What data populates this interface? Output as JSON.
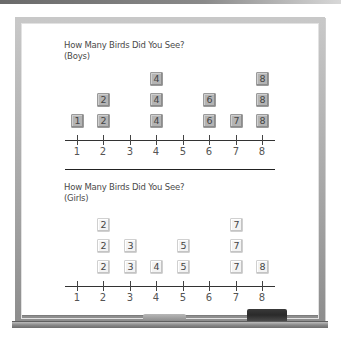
{
  "chart_data": [
    {
      "type": "dot-plot",
      "title": "How Many Birds Did You See?",
      "subtitle": "(Boys)",
      "categories": [
        1,
        2,
        3,
        4,
        5,
        6,
        7,
        8
      ],
      "values": [
        1,
        2,
        0,
        3,
        0,
        2,
        1,
        3
      ],
      "xlabel": "",
      "ylabel": "",
      "xlim": [
        1,
        8
      ],
      "tile_color": "#b4b4b4"
    },
    {
      "type": "dot-plot",
      "title": "How Many Birds Did You See?",
      "subtitle": "(Girls)",
      "categories": [
        1,
        2,
        3,
        4,
        5,
        6,
        7,
        8
      ],
      "values": [
        0,
        3,
        2,
        1,
        2,
        0,
        3,
        1
      ],
      "xlabel": "",
      "ylabel": "",
      "xlim": [
        1,
        8
      ],
      "tile_color": "#f3f3f3"
    }
  ],
  "boys": {
    "title": "How Many Birds Did You See?",
    "subtitle": "(Boys)",
    "tick_labels": [
      "1",
      "2",
      "3",
      "4",
      "5",
      "6",
      "7",
      "8"
    ]
  },
  "girls": {
    "title": "How Many Birds Did You See?",
    "subtitle": "(Girls)",
    "tick_labels": [
      "1",
      "2",
      "3",
      "4",
      "5",
      "6",
      "7",
      "8"
    ]
  }
}
